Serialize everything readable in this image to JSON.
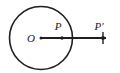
{
  "figure": {
    "background_color": "#ffffff",
    "stroke_color": "#1f1f1f",
    "canvas": {
      "width": 120,
      "height": 73
    },
    "circle": {
      "name": "circle-of-inversion",
      "center_x": 41,
      "center_y": 38,
      "radius": 31.5,
      "stroke_width": 1.6
    },
    "ray": {
      "name": "ray-O-to-Pprime",
      "x1": 41,
      "y1": 38,
      "x2": 106,
      "y2": 38,
      "stroke_width": 2.0
    },
    "points": [
      {
        "id": "O",
        "label": "O",
        "label_x": 31,
        "label_y": 42,
        "dot_x": 41,
        "dot_y": 38,
        "dot_r": 1.5,
        "font_size": 11
      },
      {
        "id": "P",
        "label": "P",
        "label_x": 58,
        "label_y": 30,
        "dot_x": 62,
        "dot_y": 38,
        "dot_r": 1.7,
        "font_size": 11
      },
      {
        "id": "Pprime",
        "label": "P′",
        "label_x": 97,
        "label_y": 30,
        "dot_x": 103,
        "dot_y": 38,
        "dot_r": 1.9,
        "font_size": 11
      }
    ],
    "tick": {
      "name": "tick-at-Pprime",
      "x": 103,
      "y1": 32,
      "y2": 44,
      "stroke_width": 1.4
    }
  }
}
